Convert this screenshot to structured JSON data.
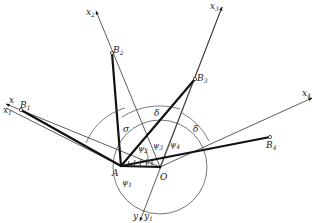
{
  "diagram": {
    "points": {
      "A": {
        "label": "A",
        "x": 121,
        "y": 166
      },
      "O": {
        "label": "O",
        "x": 160,
        "y": 167
      },
      "B1": {
        "label": "B",
        "sub": "1",
        "x": 21,
        "y": 110
      },
      "B2": {
        "label": "B",
        "sub": "2",
        "x": 112,
        "y": 53
      },
      "B3": {
        "label": "B",
        "sub": "3",
        "x": 195,
        "y": 79
      },
      "B4": {
        "label": "B",
        "sub": "4",
        "x": 270,
        "y": 137
      }
    },
    "axes": [
      {
        "id": "x",
        "label": "x",
        "sub": ""
      },
      {
        "id": "x1",
        "label": "x",
        "sub": "1"
      },
      {
        "id": "x2",
        "label": "x",
        "sub": "2"
      },
      {
        "id": "x3",
        "label": "x",
        "sub": "3"
      },
      {
        "id": "x4",
        "label": "x",
        "sub": "4"
      },
      {
        "id": "y",
        "label": "y",
        "sub": ""
      },
      {
        "id": "y1",
        "label": "y",
        "sub": "1"
      }
    ],
    "angles": [
      {
        "id": "psi1",
        "label": "ψ",
        "sub": "1"
      },
      {
        "id": "psi2",
        "label": "ψ",
        "sub": "2"
      },
      {
        "id": "psi3",
        "label": "ψ",
        "sub": "3"
      },
      {
        "id": "psi4",
        "label": "ψ",
        "sub": "4"
      },
      {
        "id": "sigma_left",
        "label": "σ"
      },
      {
        "id": "delta_mid",
        "label": "δ"
      },
      {
        "id": "delta_right",
        "label": "δ"
      }
    ]
  }
}
